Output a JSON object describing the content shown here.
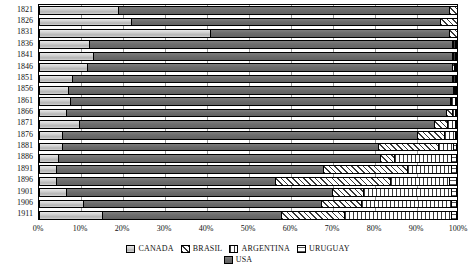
{
  "chart_data": {
    "type": "bar",
    "orientation": "horizontal",
    "stacked": true,
    "normalized": true,
    "title": "",
    "subtitle": "",
    "xlabel": "",
    "ylabel": "",
    "xlim": [
      0,
      100
    ],
    "ylim": null,
    "grid": true,
    "grid_axis": "x",
    "legend_position": "bottom",
    "x_ticks": [
      "0%",
      "10%",
      "20%",
      "30%",
      "40%",
      "50%",
      "60%",
      "70%",
      "80%",
      "90%",
      "100%"
    ],
    "x_tick_values": [
      0,
      10,
      20,
      30,
      40,
      50,
      60,
      70,
      80,
      90,
      100
    ],
    "categories": [
      "1821",
      "1826",
      "1831",
      "1836",
      "1841",
      "1846",
      "1851",
      "1856",
      "1861",
      "1866",
      "1871",
      "1876",
      "1881",
      "1886",
      "1891",
      "1896",
      "1901",
      "1906",
      "1911"
    ],
    "series": [
      {
        "name": "CANADA",
        "pattern": "solid-light-gray",
        "color": "#c9c9c9",
        "values": [
          19.0,
          22.0,
          41.0,
          12.0,
          13.0,
          11.5,
          8.0,
          7.0,
          7.5,
          6.5,
          9.5,
          5.5,
          5.5,
          4.5,
          4.0,
          4.0,
          6.5,
          10.5,
          15.0
        ]
      },
      {
        "name": "USA",
        "pattern": "solid-dark-gray",
        "color": "#6e6e6e",
        "values": [
          79.0,
          74.0,
          57.0,
          87.0,
          86.0,
          87.5,
          91.0,
          92.5,
          91.0,
          91.0,
          85.0,
          85.0,
          75.5,
          77.0,
          64.0,
          52.5,
          63.5,
          57.0,
          43.0
        ]
      },
      {
        "name": "BRASIL",
        "pattern": "diagonal-hatch",
        "color": "#d8d8d8",
        "values": [
          2.0,
          4.0,
          2.0,
          0.3,
          0.3,
          0.5,
          0.3,
          0.3,
          0.3,
          1.5,
          3.0,
          6.5,
          14.5,
          3.5,
          20.0,
          27.5,
          7.5,
          9.5,
          15.0
        ]
      },
      {
        "name": "ARGENTINA",
        "pattern": "vertical-lines",
        "color": "#ffffff",
        "values": [
          0.0,
          0.0,
          0.0,
          0.4,
          0.4,
          0.3,
          0.4,
          0.1,
          0.9,
          0.7,
          2.0,
          2.5,
          3.5,
          13.5,
          10.5,
          14.0,
          21.0,
          21.5,
          25.5
        ]
      },
      {
        "name": "URUGUAY",
        "pattern": "horizontal-lines",
        "color": "#ffffff",
        "values": [
          0.0,
          0.0,
          0.0,
          0.3,
          0.3,
          0.2,
          0.3,
          0.1,
          0.3,
          0.3,
          0.5,
          0.5,
          1.0,
          1.5,
          1.5,
          2.0,
          1.5,
          1.5,
          1.5
        ]
      }
    ]
  },
  "legend": {
    "rows": [
      [
        "CANADA",
        "BRASIL",
        "ARGENTINA",
        "URUGUAY"
      ],
      [
        "USA"
      ]
    ]
  }
}
